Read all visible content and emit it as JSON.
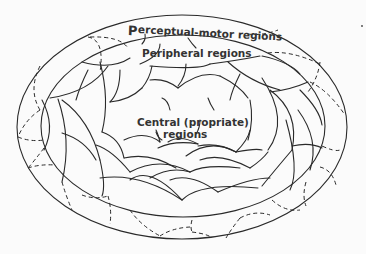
{
  "diagram": {
    "labels": {
      "perceptual_first": "P",
      "perceptual_rest": "erceptual-motor regions",
      "peripheral": "Peripheral regions",
      "central_line1": "Central (propriate)",
      "central_line2": "regions"
    },
    "stroke_color": "#2a2a2a",
    "background": "#fbfbfb"
  }
}
